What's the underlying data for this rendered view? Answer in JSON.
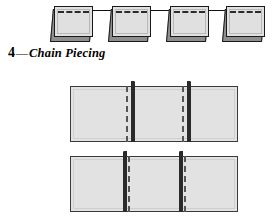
{
  "figure": {
    "name": "chain-piecing-diagram",
    "caption": {
      "number": "4",
      "dash": "—",
      "title": "Chain Piecing"
    },
    "colors": {
      "page_background": "#ffffff",
      "fabric_light": "#e2e2e2",
      "fabric_shadow": "#8e8e8e",
      "outline": "#1a1a1a",
      "seam_flap": "#2a2a2a",
      "stitch_line": "#555555",
      "thread": "#111111",
      "caption_text": "#000000"
    },
    "chain_row": {
      "name": "chain-of-pieced-squares",
      "thread_label": "connecting-thread",
      "units": [
        {
          "label": "pieced-unit-1",
          "left": 50
        },
        {
          "label": "pieced-unit-2",
          "left": 108
        },
        {
          "label": "pieced-unit-3",
          "left": 166
        },
        {
          "label": "pieced-unit-4",
          "left": 222
        }
      ],
      "threads": [
        {
          "left": 90,
          "width": 22
        },
        {
          "left": 148,
          "width": 22
        },
        {
          "left": 206,
          "width": 20
        }
      ]
    },
    "blocks": [
      {
        "label": "joined-strip-seams-folded-right",
        "fold": "right",
        "panels": 3,
        "seams": [
          {
            "label": "seam-1",
            "left": 56
          },
          {
            "label": "seam-2",
            "left": 112
          }
        ]
      },
      {
        "label": "joined-strip-seams-folded-left",
        "fold": "left",
        "panels": 3,
        "seams": [
          {
            "label": "seam-1",
            "left": 52
          },
          {
            "label": "seam-2",
            "left": 108
          }
        ]
      }
    ]
  }
}
